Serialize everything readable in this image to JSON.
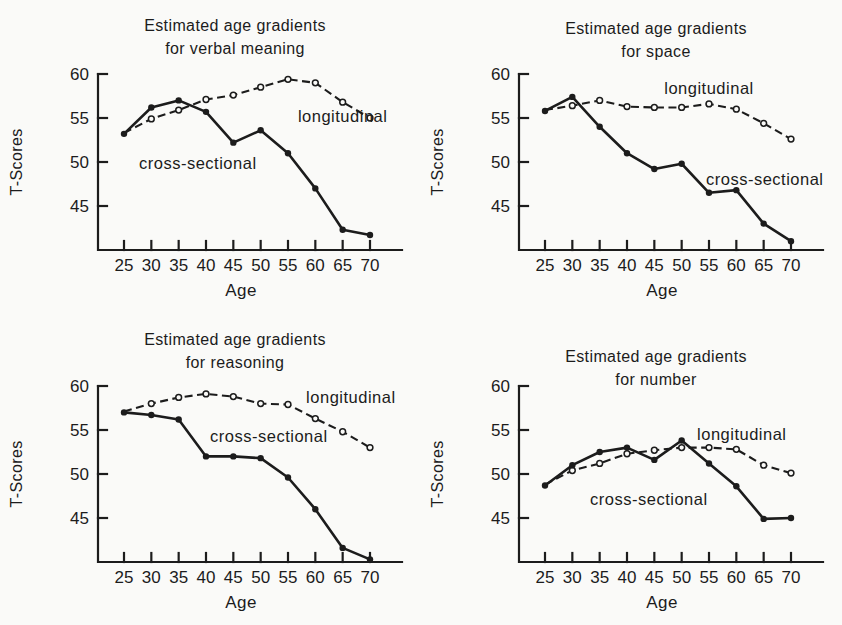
{
  "figure": {
    "ink_color": "#1c1c1c",
    "background_color": "#fafaf8"
  },
  "chart_data": [
    {
      "type": "line",
      "title_line1": "Estimated age gradients",
      "title_line2": "for verbal meaning",
      "xlabel": "Age",
      "ylabel": "T-Scores",
      "x": [
        25,
        30,
        35,
        40,
        45,
        50,
        55,
        60,
        65,
        70
      ],
      "xlim": [
        22,
        73
      ],
      "ylim": [
        40,
        60
      ],
      "yticks": [
        45,
        50,
        55,
        60
      ],
      "grid": false,
      "legend_position": "inline-labels",
      "series": [
        {
          "name": "longitudinal",
          "line": "dashed",
          "marker": "open",
          "first_marker": false,
          "values": [
            53.3,
            54.9,
            55.9,
            57.1,
            57.6,
            58.5,
            59.4,
            59.0,
            56.8,
            55.0
          ],
          "label": {
            "text": "longitudinal",
            "x": 65.0,
            "y": 55.2
          }
        },
        {
          "name": "cross-sectional",
          "line": "solid",
          "marker": "filled",
          "values": [
            53.2,
            56.2,
            57.0,
            55.7,
            52.2,
            53.6,
            51.0,
            47.0,
            42.3,
            41.7
          ],
          "label": {
            "text": "cross-sectional",
            "x": 38.5,
            "y": 49.9
          }
        }
      ]
    },
    {
      "type": "line",
      "title_line1": "Estimated age gradients",
      "title_line2": "for space",
      "xlabel": "Age",
      "ylabel": "T-Scores",
      "x": [
        25,
        30,
        35,
        40,
        45,
        50,
        55,
        60,
        65,
        70
      ],
      "xlim": [
        22,
        73
      ],
      "ylim": [
        40,
        60
      ],
      "yticks": [
        45,
        50,
        55,
        60
      ],
      "grid": false,
      "legend_position": "inline-labels",
      "series": [
        {
          "name": "longitudinal",
          "line": "dashed",
          "marker": "open",
          "first_marker": false,
          "values": [
            55.9,
            56.4,
            57.0,
            56.3,
            56.2,
            56.2,
            56.6,
            56.0,
            54.4,
            52.6
          ],
          "label": {
            "text": "longitudinal",
            "x": 55.0,
            "y": 58.4
          }
        },
        {
          "name": "cross-sectional",
          "line": "solid",
          "marker": "filled",
          "values": [
            55.8,
            57.4,
            54.0,
            51.0,
            49.2,
            49.8,
            46.5,
            46.8,
            43.0,
            41.0
          ],
          "label": {
            "text": "cross-sectional",
            "x": 65.2,
            "y": 48.1
          }
        }
      ]
    },
    {
      "type": "line",
      "title_line1": "Estimated age gradients",
      "title_line2": "for reasoning",
      "xlabel": "Age",
      "ylabel": "T-Scores",
      "x": [
        25,
        30,
        35,
        40,
        45,
        50,
        55,
        60,
        65,
        70
      ],
      "xlim": [
        22,
        73
      ],
      "ylim": [
        40,
        60
      ],
      "yticks": [
        45,
        50,
        55,
        60
      ],
      "grid": false,
      "legend_position": "inline-labels",
      "series": [
        {
          "name": "longitudinal",
          "line": "dashed",
          "marker": "open",
          "first_marker": false,
          "values": [
            57.1,
            58.0,
            58.7,
            59.1,
            58.8,
            58.0,
            57.9,
            56.3,
            54.8,
            53.0
          ],
          "label": {
            "text": "longitudinal",
            "x": 66.5,
            "y": 58.7
          }
        },
        {
          "name": "cross-sectional",
          "line": "solid",
          "marker": "filled",
          "values": [
            57.0,
            56.7,
            56.2,
            52.0,
            52.0,
            51.8,
            49.6,
            46.0,
            41.6,
            40.3
          ],
          "label": {
            "text": "cross-sectional",
            "x": 51.5,
            "y": 54.3
          }
        }
      ]
    },
    {
      "type": "line",
      "title_line1": "Estimated age gradients",
      "title_line2": "for number",
      "xlabel": "Age",
      "ylabel": "T-Scores",
      "x": [
        25,
        30,
        35,
        40,
        45,
        50,
        55,
        60,
        65,
        70
      ],
      "xlim": [
        22,
        73
      ],
      "ylim": [
        40,
        60
      ],
      "yticks": [
        45,
        50,
        55,
        60
      ],
      "grid": false,
      "legend_position": "inline-labels",
      "series": [
        {
          "name": "longitudinal",
          "line": "dashed",
          "marker": "open",
          "first_marker": false,
          "values": [
            48.8,
            50.4,
            51.2,
            52.3,
            52.7,
            53.0,
            53.0,
            52.8,
            51.0,
            50.1
          ],
          "label": {
            "text": "longitudinal",
            "x": 61.0,
            "y": 54.6
          }
        },
        {
          "name": "cross-sectional",
          "line": "solid",
          "marker": "filled",
          "values": [
            48.7,
            51.0,
            52.5,
            53.0,
            51.6,
            53.8,
            51.2,
            48.6,
            44.9,
            45.0
          ],
          "label": {
            "text": "cross-sectional",
            "x": 44.0,
            "y": 47.2
          }
        }
      ]
    }
  ]
}
